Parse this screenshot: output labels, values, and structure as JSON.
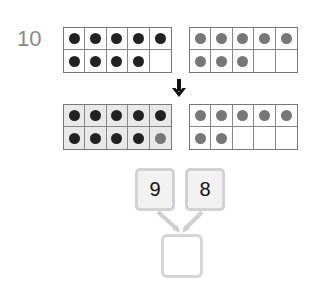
{
  "problem": {
    "number": "10"
  },
  "frames": {
    "top_left": {
      "dots": [
        "black",
        "black",
        "black",
        "black",
        "black",
        "black",
        "black",
        "black",
        "black",
        ""
      ],
      "count": 9
    },
    "top_right": {
      "dots": [
        "gray",
        "gray",
        "gray",
        "gray",
        "gray",
        "gray",
        "gray",
        "gray",
        "",
        ""
      ],
      "count": 8
    },
    "bottom_left": {
      "dots": [
        "black",
        "black",
        "black",
        "black",
        "black",
        "black",
        "black",
        "black",
        "black",
        "gray"
      ],
      "count": 10,
      "shaded": true
    },
    "bottom_right": {
      "dots": [
        "gray",
        "gray",
        "gray",
        "gray",
        "gray",
        "gray",
        "gray",
        "",
        "",
        ""
      ],
      "count": 7
    }
  },
  "arrow": {
    "icon": "down-arrow-icon"
  },
  "number_bond": {
    "left_value": "9",
    "right_value": "8",
    "answer_value": ""
  },
  "colors": {
    "black_dot": "#222222",
    "gray_dot": "#777777",
    "box_border": "#d2d2d2",
    "box_fill": "#f1f1f1"
  }
}
